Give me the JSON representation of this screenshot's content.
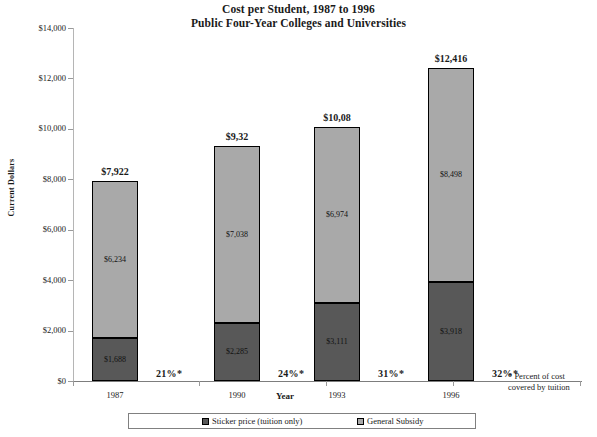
{
  "chart_data": {
    "type": "bar",
    "stacked": true,
    "title": "Cost per Student,  1987 to 1996",
    "subtitle": "Public Four-Year Colleges and Universities",
    "xlabel": "Year",
    "ylabel": "Current Dollars",
    "ylim": [
      0,
      14000
    ],
    "ytick_labels": [
      "$14,000",
      "$12,000",
      "$10,000",
      "$8,000",
      "$6,000",
      "$4,000",
      "$2,000",
      "$0"
    ],
    "ytick_values": [
      14000,
      12000,
      10000,
      8000,
      6000,
      4000,
      2000,
      0
    ],
    "grid": false,
    "legend_position": "bottom",
    "categories": [
      "1987",
      "1990",
      "1993",
      "1996"
    ],
    "series": [
      {
        "name": "Sticker price (tuition only)",
        "color": "#585858",
        "values": [
          1688,
          2285,
          3111,
          3918
        ],
        "value_labels": [
          "$1,688",
          "$2,285",
          "$3,111",
          "$3,918"
        ]
      },
      {
        "name": "General Subsidy",
        "color": "#a9a9a9",
        "values": [
          6234,
          7038,
          6974,
          8498
        ],
        "value_labels": [
          "$6,234",
          "$7,038",
          "$6,974",
          "$8,498"
        ]
      }
    ],
    "totals": [
      7922,
      9323,
      10085,
      12416
    ],
    "total_labels": [
      "$7,922",
      "$9,32",
      "$10,08",
      "$12,416"
    ],
    "annotations": {
      "percent_labels": [
        "21%*",
        "24%*",
        "31%*",
        "32%*"
      ],
      "footnote_line1": "* Percent of cost",
      "footnote_line2": "covered by tuition"
    }
  },
  "legend": {
    "items": [
      {
        "label": "Sticker price (tuition only)",
        "color": "#585858"
      },
      {
        "label": "General Subsidy",
        "color": "#a9a9a9"
      }
    ]
  }
}
